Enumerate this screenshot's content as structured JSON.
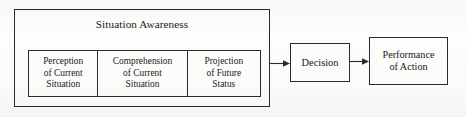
{
  "diagram": {
    "title": "Situation Awareness",
    "type": "flow-diagram",
    "colors": {
      "stroke": "#2a2a2a",
      "background": "#fbfbfa",
      "text": "#1a1a1a"
    },
    "situation_awareness": {
      "label": "Situation Awareness",
      "levels": [
        {
          "id": "perception",
          "line1": "Perception",
          "line2": "of Current",
          "line3": "Situation",
          "full_text": "Perception of Current Situation"
        },
        {
          "id": "comprehension",
          "line1": "Comprehension",
          "line2": "of Current",
          "line3": "Situation",
          "full_text": "Comprehension of Current Situation"
        },
        {
          "id": "projection",
          "line1": "Projection",
          "line2": "of Future",
          "line3": "Status",
          "full_text": "Projection of Future Status"
        }
      ]
    },
    "decision": {
      "label": "Decision"
    },
    "performance": {
      "line1": "Performance",
      "line2": "of Action",
      "full_text": "Performance of Action"
    },
    "arrows": [
      {
        "id": "sa-to-decision",
        "from": "Situation Awareness",
        "to": "Decision",
        "direction": "right"
      },
      {
        "id": "decision-to-performance",
        "from": "Decision",
        "to": "Performance of Action",
        "direction": "right"
      }
    ]
  }
}
